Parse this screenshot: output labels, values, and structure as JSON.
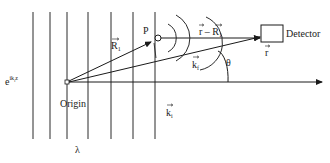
{
  "diagram": {
    "type": "scattering-geometry",
    "incident_wave_label": "e",
    "incident_wave_exponent": "ik",
    "incident_wave_exponent_sub": "i",
    "incident_wave_exponent_tail": "z",
    "origin_label": "Origin",
    "wavelength_label": "λ",
    "point_label": "P",
    "R1_label": "R",
    "R1_sub": "1",
    "r_minus_R1_label_a": "r",
    "r_minus_R1_label_minus": " – ",
    "r_minus_R1_label_b": "R",
    "r_minus_R1_sub": "1",
    "r_label": "r",
    "kf_label": "k",
    "kf_sub": "f",
    "ki_label": "k",
    "ki_sub": "i",
    "theta_label": "θ",
    "detector_label": "Detector",
    "wavefront_count": 7,
    "colors": {
      "line": "#1a1a1a",
      "wavefront": "#2a2a2a",
      "background": "#ffffff"
    }
  }
}
